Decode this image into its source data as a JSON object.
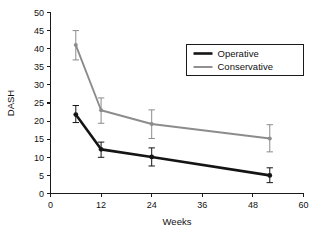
{
  "chart_data": {
    "type": "line",
    "title": "",
    "xlabel": "Weeks",
    "ylabel": "DASH",
    "xlim": [
      0,
      60
    ],
    "ylim": [
      0,
      50
    ],
    "xticks": [
      0,
      12,
      24,
      36,
      48,
      60
    ],
    "yticks": [
      0,
      5,
      10,
      15,
      20,
      25,
      30,
      35,
      40,
      45,
      50
    ],
    "grid": false,
    "legend_position": "upper right",
    "x": [
      6,
      12,
      24,
      52
    ],
    "series": [
      {
        "name": "Operative",
        "color": "#141414",
        "values": [
          21.8,
          12.2,
          10.1,
          5.0
        ],
        "err_low": [
          19.6,
          10.0,
          7.6,
          3.0
        ],
        "err_high": [
          24.3,
          14.2,
          12.6,
          7.1
        ],
        "marker": "circle"
      },
      {
        "name": "Conservative",
        "color": "#8c8c8c",
        "values": [
          41.0,
          23.0,
          19.2,
          15.2
        ],
        "err_low": [
          36.9,
          19.4,
          15.2,
          11.5
        ],
        "err_high": [
          45.0,
          26.4,
          23.1,
          19.0
        ],
        "marker": "circle"
      }
    ]
  },
  "legend": {
    "items": [
      {
        "label": "Operative"
      },
      {
        "label": "Conservative"
      }
    ]
  },
  "axes": {
    "x_title": "Weeks",
    "y_title": "DASH",
    "x_tick_labels": [
      "0",
      "12",
      "24",
      "36",
      "48",
      "60"
    ],
    "y_tick_labels": [
      "0",
      "5",
      "10",
      "15",
      "20",
      "25",
      "30",
      "35",
      "40",
      "45",
      "50"
    ]
  }
}
